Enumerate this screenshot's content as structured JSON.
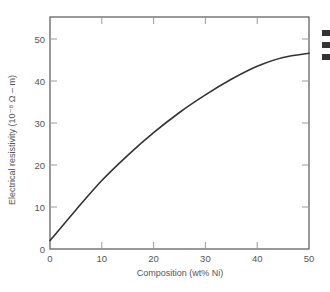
{
  "chart_data": {
    "type": "line",
    "title": "",
    "xlabel": "Composition (wt% Ni)",
    "ylabel": "Electrical resistivity (10⁻⁸ Ω – m)",
    "xlim": [
      0,
      50
    ],
    "ylim": [
      0,
      55
    ],
    "x_ticks": [
      0,
      10,
      20,
      30,
      40,
      50
    ],
    "y_ticks": [
      0,
      10,
      20,
      30,
      40,
      50
    ],
    "grid": false,
    "legend": null,
    "series": [
      {
        "name": "Cu-Ni alloy resistivity",
        "color": "#333333",
        "x": [
          0,
          5,
          10,
          15,
          20,
          25,
          30,
          35,
          40,
          45,
          50
        ],
        "y": [
          2.0,
          9.3,
          16.3,
          22.3,
          27.7,
          32.5,
          36.7,
          40.4,
          43.5,
          45.6,
          46.6
        ]
      }
    ]
  },
  "labels": {
    "x_tick_labels": [
      "0",
      "10",
      "20",
      "30",
      "40",
      "50"
    ],
    "y_tick_labels": [
      "0",
      "10",
      "20",
      "30",
      "40",
      "50"
    ],
    "xlabel": "Composition (wt% Ni)",
    "ylabel": "Electrical resistivity (10⁻⁸ Ω – m)"
  },
  "colors": {
    "frame": "#555555",
    "ticks": "#9a9a9a",
    "curve": "#333333",
    "text": "#555555"
  }
}
